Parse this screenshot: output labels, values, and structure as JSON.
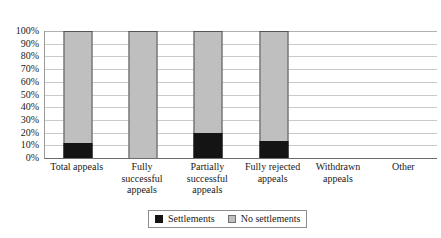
{
  "chart_data": {
    "type": "bar",
    "subtype": "stacked-percentage-column",
    "title": "",
    "xlabel": "",
    "ylabel": "",
    "ylim": [
      0,
      100
    ],
    "y_unit": "%",
    "grid": true,
    "legend_position": "bottom",
    "categories": [
      "Total appeals",
      "Fully successful appeals",
      "Partially successful appeals",
      "Fully rejected appeals",
      "Withdrawn appeals",
      "Other"
    ],
    "category_label_lines": [
      [
        "Total appeals"
      ],
      [
        "Fully",
        "successful",
        "appeals"
      ],
      [
        "Partially",
        "successful",
        "appeals"
      ],
      [
        "Fully rejected",
        "appeals"
      ],
      [
        "Withdrawn",
        "appeals"
      ],
      [
        "Other"
      ]
    ],
    "series": [
      {
        "name": "Settlements",
        "color": "#141414",
        "values": [
          12,
          0,
          20,
          13,
          null,
          null
        ]
      },
      {
        "name": "No settlements",
        "color": "#bfbfbf",
        "values": [
          88,
          100,
          80,
          87,
          null,
          null
        ]
      }
    ],
    "y_ticks": [
      "100%",
      "90%",
      "80%",
      "70%",
      "60%",
      "50%",
      "40%",
      "30%",
      "20%",
      "10%",
      "0%"
    ],
    "y_tick_values": [
      100,
      90,
      80,
      70,
      60,
      50,
      40,
      30,
      20,
      10,
      0
    ],
    "bars_present": [
      true,
      true,
      true,
      true,
      false,
      false
    ]
  },
  "legend": {
    "items": [
      {
        "label": "Settlements",
        "color": "#141414"
      },
      {
        "label": "No settlements",
        "color": "#bfbfbf"
      }
    ]
  },
  "colors": {
    "settlements": "#141414",
    "no_settlements": "#bfbfbf",
    "gridline": "#c9c9c9",
    "axis": "#6b6b6b",
    "text": "#1a1a1a",
    "background": "#ffffff"
  }
}
